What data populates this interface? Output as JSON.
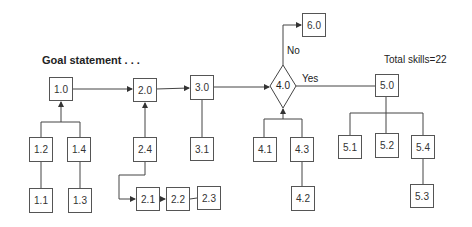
{
  "diagram": {
    "goal_label": "Goal statement . . .",
    "total_label": "Total skills=22",
    "decision": {
      "id": "4.0",
      "no_label": "No",
      "yes_label": "Yes"
    },
    "nodes": {
      "n1_0": "1.0",
      "n1_1": "1.1",
      "n1_2": "1.2",
      "n1_3": "1.3",
      "n1_4": "1.4",
      "n2_0": "2.0",
      "n2_1": "2.1",
      "n2_2": "2.2",
      "n2_3": "2.3",
      "n2_4": "2.4",
      "n3_0": "3.0",
      "n3_1": "3.1",
      "n4_1": "4.1",
      "n4_2": "4.2",
      "n4_3": "4.3",
      "n5_0": "5.0",
      "n5_1": "5.1",
      "n5_2": "5.2",
      "n5_3": "5.3",
      "n5_4": "5.4",
      "n6_0": "6.0"
    }
  }
}
